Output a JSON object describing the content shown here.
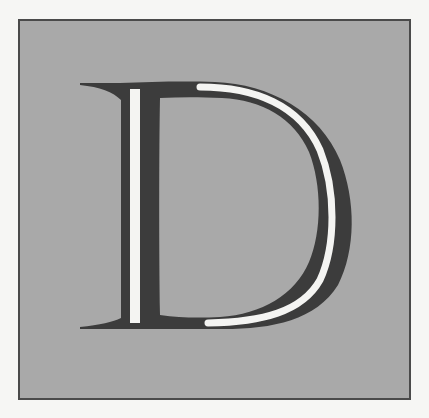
{
  "dropcap": {
    "letter": "D",
    "style": "decorative inline serif initial",
    "colors": {
      "background": "#f6f6f4",
      "box_fill": "#a9a9a9",
      "box_border": "#4a4a4a",
      "letter_fill": "#3c3c3c",
      "inline_highlight": "#f4f4f2"
    }
  }
}
